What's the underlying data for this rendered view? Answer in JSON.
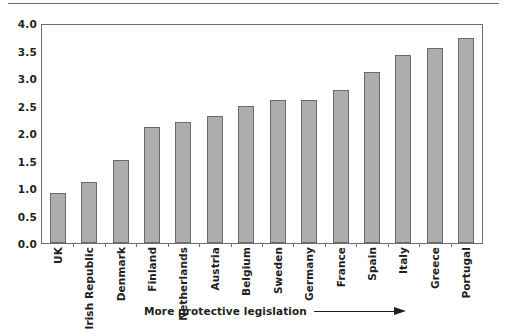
{
  "chart_data": {
    "type": "bar",
    "title": "",
    "xlabel": "More protective legislation",
    "ylabel": "",
    "categories": [
      "UK",
      "Irish Republic",
      "Denmark",
      "Finland",
      "Netherlands",
      "Austria",
      "Belgium",
      "Sweden",
      "Germany",
      "France",
      "Spain",
      "Italy",
      "Greece",
      "Portugal"
    ],
    "values": [
      0.92,
      1.12,
      1.52,
      2.12,
      2.22,
      2.33,
      2.52,
      2.62,
      2.63,
      2.8,
      3.13,
      3.45,
      3.58,
      3.77
    ],
    "ylim": [
      0.0,
      4.0
    ],
    "ytick_labels": [
      "4.0",
      "3.5",
      "3.0",
      "2.5",
      "2.0",
      "1.5",
      "1.0",
      "0.5",
      "0.0"
    ],
    "ytick_values": [
      4.0,
      3.5,
      3.0,
      2.5,
      2.0,
      1.5,
      1.0,
      0.5,
      0.0
    ],
    "grid": false,
    "legend": null,
    "legend_position": "none",
    "bar_color": "#adadad",
    "bar_border_color": "#6b6b6b",
    "axis_color": "#6e6e6e",
    "text_color": "#231f20",
    "annotation": {
      "text": "More protective legislation",
      "arrow": "right-arrow-icon"
    }
  }
}
